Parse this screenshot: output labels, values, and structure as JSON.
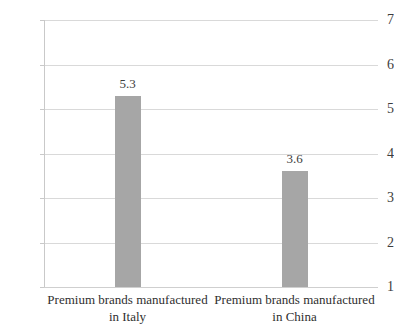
{
  "chart_data": {
    "type": "bar",
    "title": "",
    "subtitle": "",
    "xlabel": "",
    "ylabel": "",
    "categories": [
      "Premium brands manufactured in Italy",
      "Premium brands manufactured in China"
    ],
    "category_lines": [
      [
        "Premium brands manufactured",
        "in Italy"
      ],
      [
        "Premium brands manufactured",
        "in China"
      ]
    ],
    "values": [
      5.3,
      3.6
    ],
    "value_labels": [
      "5.3",
      "3.6"
    ],
    "ylim": [
      1,
      7
    ],
    "ytick_labels": [
      "7",
      "6",
      "5",
      "4",
      "3",
      "2",
      "1"
    ],
    "ytick_values": [
      7,
      6,
      5,
      4,
      3,
      2,
      1
    ],
    "grid": true,
    "legend": false,
    "legend_position": "none",
    "orientation": "vertical",
    "colors": {
      "bar": "#a6a6a6",
      "gridline": "#d9d9d9",
      "axis": "#c9c9c9",
      "text": "#3d3d3d",
      "background": "#ffffff"
    }
  }
}
